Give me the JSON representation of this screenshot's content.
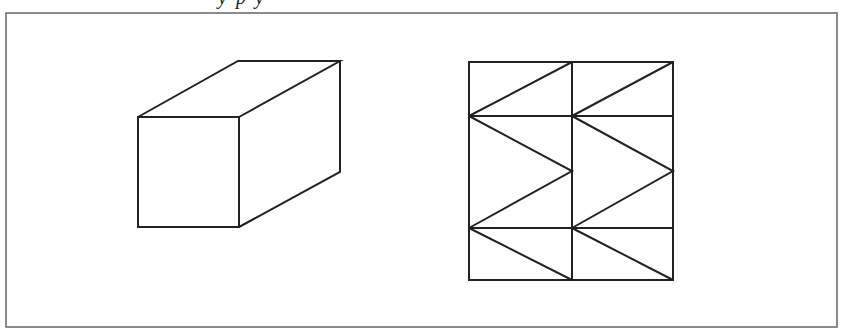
{
  "caption": {
    "visible_fragment": "y   p   y",
    "note_clipped": true
  },
  "frame": {
    "x": 6,
    "y": 13,
    "width": 831,
    "height": 314,
    "stroke": "#666666"
  },
  "colors": {
    "line": "#222222",
    "background": "#ffffff"
  },
  "figures": [
    {
      "name": "rectangular-prism",
      "description": "3D box drawn in oblique projection",
      "front_face": [
        [
          138,
          117
        ],
        [
          239,
          117
        ],
        [
          239,
          227
        ],
        [
          138,
          227
        ]
      ],
      "back_edges": [
        [
          [
            138,
            117
          ],
          [
            238,
            61
          ]
        ],
        [
          [
            238,
            61
          ],
          [
            340,
            61
          ]
        ],
        [
          [
            239,
            117
          ],
          [
            340,
            61
          ]
        ],
        [
          [
            340,
            61
          ],
          [
            340,
            172
          ]
        ],
        [
          [
            239,
            227
          ],
          [
            340,
            172
          ]
        ]
      ]
    },
    {
      "name": "prism-net-grid",
      "description": "2-column by 3-row grid with zigzag diagonals",
      "outer": {
        "x": 469,
        "y": 62,
        "width": 204,
        "height": 218
      },
      "vertical_lines_x": [
        572
      ],
      "horizontal_lines_y": [
        116,
        228
      ],
      "diagonals": [
        [
          [
            469,
            116
          ],
          [
            572,
            62
          ]
        ],
        [
          [
            572,
            116
          ],
          [
            673,
            62
          ]
        ],
        [
          [
            469,
            116
          ],
          [
            572,
            171
          ]
        ],
        [
          [
            572,
            171
          ],
          [
            469,
            228
          ]
        ],
        [
          [
            572,
            116
          ],
          [
            673,
            171
          ]
        ],
        [
          [
            673,
            171
          ],
          [
            572,
            228
          ]
        ],
        [
          [
            469,
            228
          ],
          [
            572,
            280
          ]
        ],
        [
          [
            572,
            228
          ],
          [
            673,
            280
          ]
        ]
      ]
    }
  ]
}
